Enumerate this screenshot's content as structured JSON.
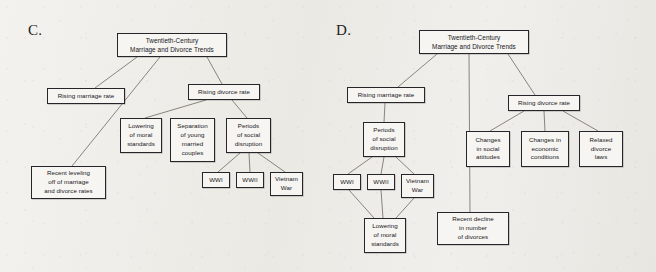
{
  "panels": [
    {
      "label": "C.",
      "label_pos": {
        "x": 28,
        "y": 22
      },
      "nodes": [
        {
          "id": "c-root",
          "name": "node-twentieth-century-trends",
          "text": "Twentieth-Century\nMarriage and Divorce Trends",
          "x": 117,
          "y": 33,
          "w": 110,
          "h": 24,
          "root": true
        },
        {
          "id": "c-marriage",
          "name": "node-rising-marriage-rate",
          "text": "Rising marriage rate",
          "x": 47,
          "y": 88,
          "w": 78,
          "h": 16
        },
        {
          "id": "c-divorce",
          "name": "node-rising-divorce-rate",
          "text": "Rising divorce rate",
          "x": 188,
          "y": 84,
          "w": 72,
          "h": 16
        },
        {
          "id": "c-lowering",
          "name": "node-lowering-of-moral-standards",
          "text": "Lowering\nof moral\nstandards",
          "x": 120,
          "y": 118,
          "w": 42,
          "h": 35
        },
        {
          "id": "c-separation",
          "name": "node-separation-of-young-married-couples",
          "text": "Separation\nof young\nmarried\ncouples",
          "x": 170,
          "y": 118,
          "w": 45,
          "h": 44
        },
        {
          "id": "c-periods",
          "name": "node-periods-of-social-disruption",
          "text": "Periods\nof social\ndisruption",
          "x": 226,
          "y": 118,
          "w": 45,
          "h": 35
        },
        {
          "id": "c-wwi",
          "name": "node-wwi",
          "text": "WWI",
          "x": 202,
          "y": 172,
          "w": 28,
          "h": 16
        },
        {
          "id": "c-wwii",
          "name": "node-wwii",
          "text": "WWII",
          "x": 236,
          "y": 172,
          "w": 28,
          "h": 16
        },
        {
          "id": "c-vietnam",
          "name": "node-vietnam-war",
          "text": "Vietnam\nWar",
          "x": 270,
          "y": 172,
          "w": 33,
          "h": 24
        },
        {
          "id": "c-leveling",
          "name": "node-recent-leveling-off",
          "text": "Recent leveling\noff of marriage\nand divorce rates",
          "x": 31,
          "y": 166,
          "w": 75,
          "h": 33
        }
      ],
      "edges": [
        {
          "from": "c-root",
          "to": "c-marriage",
          "x1": 137,
          "y1": 57,
          "x2": 95,
          "y2": 88
        },
        {
          "from": "c-root",
          "to": "c-leveling",
          "x1": 160,
          "y1": 57,
          "x2": 72,
          "y2": 166
        },
        {
          "from": "c-root",
          "to": "c-divorce",
          "x1": 207,
          "y1": 57,
          "x2": 222,
          "y2": 84
        },
        {
          "from": "c-divorce",
          "to": "c-lowering",
          "x1": 206,
          "y1": 100,
          "x2": 145,
          "y2": 118
        },
        {
          "from": "c-divorce",
          "to": "c-periods",
          "x1": 232,
          "y1": 100,
          "x2": 247,
          "y2": 118
        },
        {
          "from": "c-periods",
          "to": "c-wwi",
          "x1": 240,
          "y1": 153,
          "x2": 218,
          "y2": 172
        },
        {
          "from": "c-periods",
          "to": "c-wwii",
          "x1": 249,
          "y1": 153,
          "x2": 250,
          "y2": 172
        },
        {
          "from": "c-periods",
          "to": "c-vietnam",
          "x1": 258,
          "y1": 153,
          "x2": 285,
          "y2": 172
        }
      ]
    },
    {
      "label": "D.",
      "label_pos": {
        "x": 336,
        "y": 22
      },
      "nodes": [
        {
          "id": "d-root",
          "name": "node-twentieth-century-trends",
          "text": "Twentieth-Century\nMarriage and Divorce Trends",
          "x": 419,
          "y": 30,
          "w": 110,
          "h": 24,
          "root": true
        },
        {
          "id": "d-marriage",
          "name": "node-rising-marriage-rate",
          "text": "Rising marriage rate",
          "x": 347,
          "y": 87,
          "w": 78,
          "h": 16
        },
        {
          "id": "d-divorce",
          "name": "node-rising-divorce-rate",
          "text": "Rising divorce rate",
          "x": 508,
          "y": 95,
          "w": 72,
          "h": 16
        },
        {
          "id": "d-periods",
          "name": "node-periods-of-social-disruption",
          "text": "Periods\nof social\ndisruption",
          "x": 363,
          "y": 122,
          "w": 42,
          "h": 35
        },
        {
          "id": "d-wwi",
          "name": "node-wwi",
          "text": "WWI",
          "x": 333,
          "y": 174,
          "w": 28,
          "h": 16
        },
        {
          "id": "d-wwii",
          "name": "node-wwii",
          "text": "WWII",
          "x": 367,
          "y": 174,
          "w": 28,
          "h": 16
        },
        {
          "id": "d-vietnam",
          "name": "node-vietnam-war",
          "text": "Vietnam\nWar",
          "x": 401,
          "y": 174,
          "w": 33,
          "h": 24
        },
        {
          "id": "d-lowering",
          "name": "node-lowering-of-moral-standards",
          "text": "Lowering\nof moral\nstandards",
          "x": 364,
          "y": 218,
          "w": 42,
          "h": 35
        },
        {
          "id": "d-decline",
          "name": "node-recent-decline-in-divorces",
          "text": "Recent decline\nin number\nof divorces",
          "x": 437,
          "y": 212,
          "w": 72,
          "h": 33
        },
        {
          "id": "d-social",
          "name": "node-changes-in-social-attitudes",
          "text": "Changes\nin social\nattitudes",
          "x": 466,
          "y": 131,
          "w": 44,
          "h": 36
        },
        {
          "id": "d-economic",
          "name": "node-changes-in-economic-conditions",
          "text": "Changes in\neconomic\nconditions",
          "x": 521,
          "y": 131,
          "w": 48,
          "h": 36
        },
        {
          "id": "d-relaxed",
          "name": "node-relaxed-divorce-laws",
          "text": "Relaxed\ndivorce\nlaws",
          "x": 579,
          "y": 131,
          "w": 44,
          "h": 36
        }
      ],
      "edges": [
        {
          "from": "d-root",
          "to": "d-marriage",
          "x1": 437,
          "y1": 54,
          "x2": 398,
          "y2": 87
        },
        {
          "from": "d-root",
          "to": "d-decline",
          "x1": 469,
          "y1": 54,
          "x2": 470,
          "y2": 212
        },
        {
          "from": "d-root",
          "to": "d-divorce",
          "x1": 508,
          "y1": 54,
          "x2": 535,
          "y2": 95
        },
        {
          "from": "d-marriage",
          "to": "d-periods",
          "x1": 385,
          "y1": 103,
          "x2": 384,
          "y2": 122
        },
        {
          "from": "d-periods",
          "to": "d-wwi",
          "x1": 372,
          "y1": 157,
          "x2": 348,
          "y2": 174
        },
        {
          "from": "d-periods",
          "to": "d-wwii",
          "x1": 384,
          "y1": 157,
          "x2": 381,
          "y2": 174
        },
        {
          "from": "d-periods",
          "to": "d-vietnam",
          "x1": 396,
          "y1": 157,
          "x2": 414,
          "y2": 174
        },
        {
          "from": "d-wwi",
          "to": "d-lowering",
          "x1": 349,
          "y1": 190,
          "x2": 374,
          "y2": 218
        },
        {
          "from": "d-wwii",
          "to": "d-lowering",
          "x1": 381,
          "y1": 190,
          "x2": 383,
          "y2": 218
        },
        {
          "from": "d-vietnam",
          "to": "d-lowering",
          "x1": 414,
          "y1": 198,
          "x2": 396,
          "y2": 218
        },
        {
          "from": "d-divorce",
          "to": "d-social",
          "x1": 524,
          "y1": 111,
          "x2": 490,
          "y2": 131
        },
        {
          "from": "d-divorce",
          "to": "d-economic",
          "x1": 544,
          "y1": 111,
          "x2": 545,
          "y2": 131
        },
        {
          "from": "d-divorce",
          "to": "d-relaxed",
          "x1": 563,
          "y1": 111,
          "x2": 598,
          "y2": 131
        }
      ]
    }
  ],
  "colors": {
    "background": "#efeeea",
    "node_fill": "#f6f5f2",
    "node_border": "#26262a",
    "edge": "#6d6a66",
    "text": "#16161a"
  }
}
